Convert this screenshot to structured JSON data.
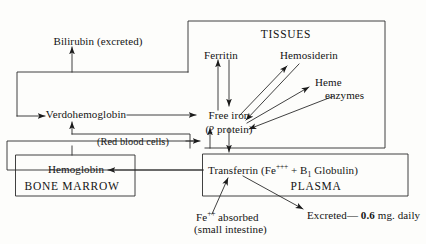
{
  "figure": {
    "kind": "flow-diagram",
    "background_color": "#fdfdfb",
    "ink_color": "#1a1a1a"
  },
  "compartments": {
    "tissues": {
      "label": "TISSUES"
    },
    "plasma": {
      "label": "PLASMA"
    },
    "bone_marrow": {
      "label": "BONE MARROW"
    }
  },
  "nodes": {
    "bilirubin": {
      "label": "Bilirubin (excreted)"
    },
    "verdohemoglobin": {
      "label": "Verdohemoglobin"
    },
    "red_blood_cells": {
      "label": "(Red blood cells)"
    },
    "hemoglobin": {
      "label": "Hemoglobin"
    },
    "ferritin": {
      "label": "Ferritin"
    },
    "hemosiderin": {
      "label": "Hemosiderin"
    },
    "heme_line1": {
      "label": "Heme"
    },
    "heme_line2": {
      "label": "enzymes"
    },
    "free_iron_line1": {
      "label": "Free iron"
    },
    "free_iron_line2": {
      "label": "(? protein)"
    },
    "transferrin": {
      "prefix": "Transferrin (Fe",
      "charge": "+++",
      "middle": " + B",
      "subscript": "1",
      "suffix": " Globulin)"
    },
    "absorbed_line1_prefix": "Fe",
    "absorbed_line1_charge": "++",
    "absorbed_line1_suffix": " absorbed",
    "absorbed_line2": "(small intestine)",
    "excreted_prefix": "Excreted— ",
    "excreted_amount": "0.6",
    "excreted_suffix": " mg. daily"
  }
}
